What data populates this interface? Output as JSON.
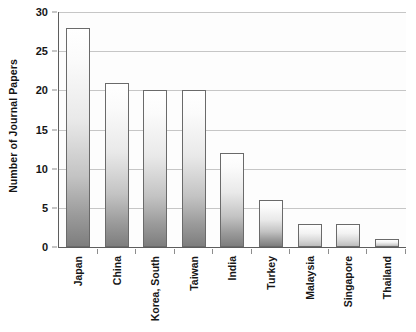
{
  "chart_data": {
    "type": "bar",
    "title": "",
    "xlabel": "",
    "ylabel": "Number of Journal Papers",
    "categories": [
      "Japan",
      "China",
      "Korea, South",
      "Taiwan",
      "India",
      "Turkey",
      "Malaysia",
      "Singapore",
      "Thailand"
    ],
    "values": [
      28,
      21,
      20,
      20,
      12,
      6,
      3,
      3,
      1
    ],
    "ylim": [
      0,
      30
    ],
    "y_ticks": [
      0,
      5,
      10,
      15,
      20,
      25,
      30
    ],
    "y_tick_labels": [
      "0",
      "5",
      "10",
      "15",
      "20",
      "25",
      "30"
    ],
    "grid": true,
    "grid_axis": "y",
    "legend": false,
    "legend_position": "none",
    "bar_fill": "vertical-gradient-white-to-gray",
    "bar_edge_color": "#6a6a6a",
    "gridline_color": "#c6c6c6",
    "axis_color": "#5d5d5d",
    "text_color": "#161616",
    "background_color": "#ffffff"
  }
}
